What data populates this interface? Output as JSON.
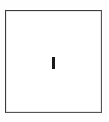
{
  "canvas": {
    "width": 109,
    "height": 122,
    "background_color": "#fefefe"
  },
  "text_field": {
    "name": "text-input-field",
    "state": "focused-empty",
    "value": "",
    "placeholder": "",
    "background_color": "#ffffff",
    "border_color": "#4e4e4e",
    "border_width_px": 1,
    "x": 5,
    "y": 10,
    "width": 97,
    "height": 103,
    "caret": {
      "icon": "text-caret-icon",
      "visible": true,
      "color": "#191919",
      "x": 52,
      "y": 57,
      "width": 3,
      "height": 12
    }
  }
}
